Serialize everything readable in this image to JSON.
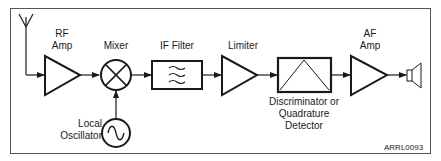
{
  "diagram": {
    "blocks": [
      {
        "id": "antenna",
        "icon": "antenna-icon"
      },
      {
        "id": "rf_amp",
        "label_line1": "RF",
        "label_line2": "Amp",
        "icon": "amplifier-triangle-icon"
      },
      {
        "id": "mixer",
        "label": "Mixer",
        "icon": "mixer-x-circle-icon"
      },
      {
        "id": "local_osc",
        "label_line1": "Local",
        "label_line2": "Oscillator",
        "icon": "sine-wave-circle-icon"
      },
      {
        "id": "if_filter",
        "label": "IF Filter",
        "icon": "filter-waves-icon"
      },
      {
        "id": "limiter",
        "label": "Limiter",
        "icon": "amplifier-triangle-icon"
      },
      {
        "id": "discriminator",
        "label_line1": "Discriminator or",
        "label_line2": "Quadrature",
        "label_line3": "Detector",
        "icon": "detector-box-icon"
      },
      {
        "id": "af_amp",
        "label_line1": "AF",
        "label_line2": "Amp",
        "icon": "amplifier-triangle-icon"
      },
      {
        "id": "speaker",
        "icon": "speaker-icon"
      }
    ],
    "figure_code": "ARRL0093",
    "colors": {
      "stroke": "#1a1a1a",
      "frame": "#555555",
      "background": "#ffffff"
    }
  }
}
